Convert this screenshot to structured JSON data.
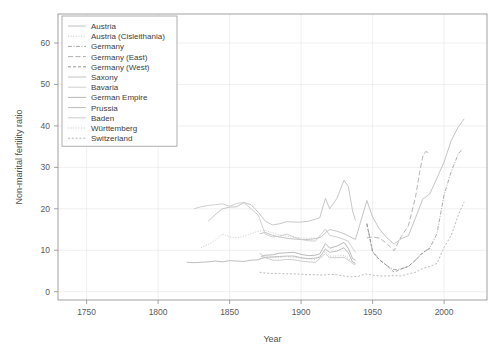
{
  "chart_data": {
    "type": "line",
    "title": "",
    "xlabel": "Year",
    "ylabel": "Non-marital fertility ratio",
    "xlim": [
      1730,
      2030
    ],
    "ylim": [
      -2,
      67
    ],
    "xticks": [
      1750,
      1800,
      1850,
      1900,
      1950,
      2000
    ],
    "yticks": [
      0,
      10,
      20,
      30,
      40,
      50,
      60
    ],
    "grid": true,
    "legend_position": "top-left",
    "legend_entries": [
      "Austria",
      "Austria (Cisleithania)",
      "Germany",
      "Germany (East)",
      "Germany (West)",
      "Saxony",
      "Bavaria",
      "German Empire",
      "Prussia",
      "Baden",
      "Württemberg",
      "Switzerland"
    ],
    "series": [
      {
        "name": "Austria",
        "dash": "solid",
        "color": "#b9b9b9",
        "x": [
          1871,
          1875,
          1880,
          1885,
          1890,
          1895,
          1900,
          1905,
          1910,
          1914,
          1918,
          1920,
          1925,
          1930,
          1934,
          1938,
          1946,
          1950,
          1955,
          1960,
          1965,
          1970,
          1975,
          1980,
          1985,
          1990,
          1995,
          2000,
          2005,
          2010,
          2014
        ],
        "y": [
          14.0,
          14.3,
          13.6,
          13.2,
          12.9,
          12.7,
          12.6,
          12.6,
          12.8,
          13.2,
          14.5,
          15.0,
          14.6,
          14.0,
          13.3,
          12.6,
          22.0,
          18.0,
          15.0,
          13.0,
          11.5,
          12.8,
          13.5,
          17.8,
          22.3,
          23.6,
          27.4,
          31.3,
          36.5,
          39.8,
          41.7
        ]
      },
      {
        "name": "Austria (Cisleithania)",
        "dash": "dotted",
        "color": "#c2c2c2",
        "x": [
          1830,
          1835,
          1840,
          1845,
          1850,
          1855,
          1860,
          1865,
          1870,
          1875,
          1880,
          1885,
          1890,
          1895,
          1900,
          1905,
          1910
        ],
        "y": [
          10.6,
          11.4,
          12.4,
          13.9,
          13.2,
          13.0,
          13.4,
          14.0,
          14.6,
          14.8,
          14.2,
          13.7,
          13.4,
          13.1,
          13.0,
          12.9,
          13.0
        ]
      },
      {
        "name": "Germany",
        "dash": "dash-dot",
        "color": "#9d9d9d",
        "x": [
          1946,
          1950,
          1955,
          1960,
          1965,
          1970,
          1975,
          1980,
          1985,
          1990,
          1995,
          2000,
          2005,
          2010,
          2013
        ],
        "y": [
          16.5,
          9.7,
          7.7,
          6.3,
          5.3,
          5.5,
          6.1,
          7.6,
          9.4,
          10.5,
          14.0,
          23.4,
          29.0,
          33.3,
          34.5
        ]
      },
      {
        "name": "Germany (East)",
        "dash": "long-dash",
        "color": "#a8a8a8",
        "x": [
          1946,
          1950,
          1955,
          1960,
          1965,
          1970,
          1975,
          1980,
          1983,
          1985,
          1987,
          1989
        ],
        "y": [
          13.0,
          13.2,
          12.9,
          11.6,
          9.9,
          13.3,
          15.9,
          22.8,
          29.0,
          32.5,
          33.8,
          33.6
        ]
      },
      {
        "name": "Germany (West)",
        "dash": "dashed",
        "color": "#8c8c8c",
        "x": [
          1946,
          1950,
          1955,
          1960,
          1965,
          1970,
          1975,
          1980,
          1985,
          1990
        ],
        "y": [
          16.3,
          9.6,
          7.6,
          6.3,
          4.7,
          5.5,
          6.1,
          7.6,
          9.4,
          10.5
        ]
      },
      {
        "name": "Saxony",
        "dash": "solid",
        "color": "#bdbdbd",
        "x": [
          1835,
          1840,
          1845,
          1850,
          1855,
          1860,
          1865,
          1870,
          1875,
          1880,
          1885,
          1890,
          1895,
          1900,
          1905,
          1910,
          1913,
          1917,
          1920,
          1925,
          1930,
          1933,
          1936,
          1938
        ],
        "y": [
          17.0,
          18.6,
          20.0,
          20.4,
          20.5,
          21.5,
          21.0,
          19.2,
          17.0,
          16.1,
          16.4,
          16.9,
          16.8,
          16.8,
          17.0,
          17.5,
          17.8,
          22.5,
          20.0,
          22.5,
          26.9,
          25.4,
          19.5,
          17.2
        ]
      },
      {
        "name": "Bavaria",
        "dash": "solid",
        "color": "#c8c8c8",
        "x": [
          1825,
          1830,
          1835,
          1840,
          1845,
          1850,
          1855,
          1860,
          1865,
          1870,
          1875,
          1880,
          1885,
          1890,
          1895,
          1900,
          1905,
          1910,
          1917,
          1920,
          1925,
          1930,
          1933,
          1936,
          1938
        ],
        "y": [
          20.0,
          20.5,
          20.8,
          21.0,
          21.2,
          20.6,
          21.3,
          21.5,
          20.0,
          18.5,
          13.9,
          13.2,
          13.4,
          13.9,
          13.2,
          12.6,
          12.3,
          12.2,
          15.1,
          13.6,
          13.2,
          12.6,
          12.2,
          10.5,
          9.5
        ]
      },
      {
        "name": "German Empire",
        "dash": "solid",
        "color": "#adadad",
        "x": [
          1872,
          1875,
          1880,
          1885,
          1890,
          1895,
          1900,
          1905,
          1910,
          1913,
          1917,
          1919,
          1920,
          1925,
          1930,
          1933,
          1936,
          1938
        ],
        "y": [
          8.5,
          8.8,
          8.9,
          9.3,
          9.4,
          9.5,
          9.0,
          8.7,
          8.8,
          9.1,
          11.6,
          10.9,
          10.5,
          11.0,
          11.9,
          10.5,
          8.0,
          7.6
        ]
      },
      {
        "name": "Prussia",
        "dash": "solid",
        "color": "#b3b3b3",
        "x": [
          1820,
          1825,
          1830,
          1835,
          1840,
          1845,
          1850,
          1855,
          1860,
          1865,
          1870,
          1875,
          1880,
          1885,
          1890,
          1895,
          1900,
          1905,
          1910,
          1913,
          1917,
          1920,
          1925,
          1930,
          1933,
          1936,
          1938
        ],
        "y": [
          7.1,
          7.0,
          7.1,
          7.2,
          7.4,
          7.2,
          7.5,
          7.4,
          7.3,
          7.6,
          7.7,
          8.3,
          8.4,
          8.5,
          8.6,
          8.6,
          8.2,
          8.0,
          8.1,
          8.3,
          10.3,
          9.5,
          9.8,
          10.6,
          9.4,
          7.2,
          6.8
        ]
      },
      {
        "name": "Baden",
        "dash": "solid",
        "color": "#c5c5c5",
        "x": [
          1871,
          1875,
          1880,
          1885,
          1890,
          1895,
          1900,
          1905,
          1910,
          1917,
          1920,
          1925,
          1930,
          1933,
          1936,
          1938
        ],
        "y": [
          9.3,
          8.2,
          7.6,
          7.6,
          7.8,
          7.7,
          7.4,
          7.2,
          7.1,
          9.2,
          8.2,
          8.2,
          8.3,
          7.6,
          6.8,
          6.5
        ]
      },
      {
        "name": "Württemberg",
        "dash": "dotted",
        "color": "#bababa",
        "x": [
          1871,
          1875,
          1880,
          1885,
          1890,
          1895,
          1900,
          1905,
          1910,
          1917,
          1920,
          1925,
          1930,
          1933,
          1936,
          1938
        ],
        "y": [
          8.0,
          8.3,
          8.2,
          8.3,
          8.5,
          8.3,
          8.1,
          7.9,
          7.8,
          9.7,
          8.6,
          8.6,
          8.8,
          8.0,
          7.2,
          6.9
        ]
      },
      {
        "name": "Switzerland",
        "dash": "short-dash",
        "color": "#b0b0b0",
        "x": [
          1871,
          1875,
          1880,
          1885,
          1890,
          1895,
          1900,
          1905,
          1910,
          1915,
          1920,
          1925,
          1930,
          1935,
          1940,
          1945,
          1950,
          1955,
          1960,
          1965,
          1970,
          1975,
          1980,
          1985,
          1990,
          1995,
          2000,
          2005,
          2010,
          2014
        ],
        "y": [
          4.7,
          4.5,
          4.4,
          4.4,
          4.3,
          4.3,
          4.2,
          4.1,
          4.1,
          4.0,
          4.2,
          4.1,
          3.8,
          3.6,
          3.7,
          4.3,
          4.0,
          3.8,
          3.8,
          3.9,
          3.8,
          4.3,
          4.7,
          5.6,
          6.1,
          6.8,
          10.7,
          13.6,
          18.6,
          21.7
        ]
      }
    ]
  }
}
